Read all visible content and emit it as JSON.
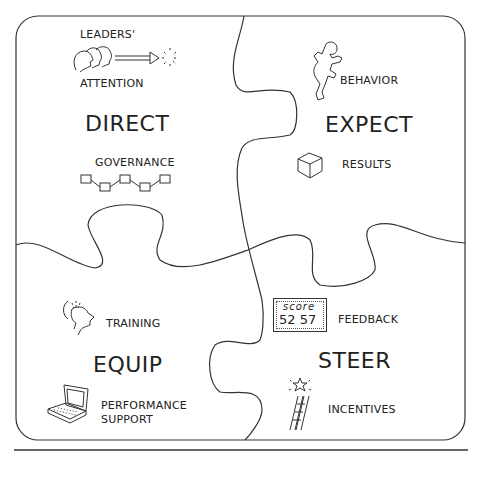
{
  "diagram": {
    "type": "jigsaw-puzzle",
    "pieces": [
      {
        "title": "DIRECT",
        "items": [
          {
            "label_top": "LEADERS'",
            "label_bottom": "ATTENTION",
            "icon": "leaders-heads-arrow-icon"
          },
          {
            "label": "GOVERNANCE",
            "icon": "governance-chain-icon"
          }
        ]
      },
      {
        "title": "EXPECT",
        "items": [
          {
            "label": "BEHAVIOR",
            "icon": "running-person-icon"
          },
          {
            "label": "RESULTS",
            "icon": "cube-icon"
          }
        ]
      },
      {
        "title": "EQUIP",
        "items": [
          {
            "label": "TRAINING",
            "icon": "head-learning-icon"
          },
          {
            "label_line1": "PERFORMANCE",
            "label_line2": "SUPPORT",
            "icon": "laptop-icon"
          }
        ]
      },
      {
        "title": "STEER",
        "items": [
          {
            "label": "FEEDBACK",
            "icon": "scoreboard-icon",
            "scoreboard": {
              "title": "score",
              "values": "52 57"
            }
          },
          {
            "label": "INCENTIVES",
            "icon": "ladder-star-icon"
          }
        ]
      }
    ]
  }
}
